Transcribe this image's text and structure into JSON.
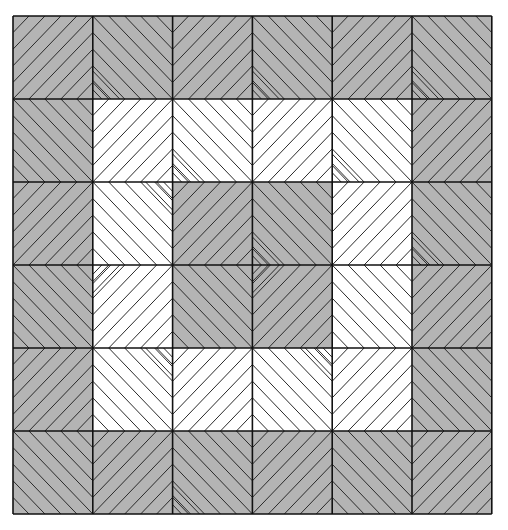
{
  "pattern": {
    "grid": {
      "rows": 6,
      "cols": 6,
      "left": 13,
      "top": 16,
      "cell_w": 79.8,
      "cell_h": 83
    },
    "colors": {
      "gray": "#b4b4b4",
      "white": "#ffffff",
      "line": "#2a2a2a",
      "border": "#111111"
    },
    "cells": [
      [
        {
          "fill": "gray",
          "dir": "up"
        },
        {
          "fill": "gray",
          "dir": "down",
          "corner": "bl"
        },
        {
          "fill": "gray",
          "dir": "up"
        },
        {
          "fill": "gray",
          "dir": "down",
          "corner": "bl"
        },
        {
          "fill": "gray",
          "dir": "up"
        },
        {
          "fill": "gray",
          "dir": "down",
          "corner": "bl"
        }
      ],
      [
        {
          "fill": "gray",
          "dir": "down"
        },
        {
          "fill": "white",
          "dir": "up"
        },
        {
          "fill": "white",
          "dir": "down",
          "corner": "bl"
        },
        {
          "fill": "white",
          "dir": "up"
        },
        {
          "fill": "white",
          "dir": "down",
          "corner": "bl"
        },
        {
          "fill": "gray",
          "dir": "up"
        }
      ],
      [
        {
          "fill": "gray",
          "dir": "up"
        },
        {
          "fill": "white",
          "dir": "down",
          "corner": "tr"
        },
        {
          "fill": "gray",
          "dir": "up"
        },
        {
          "fill": "gray",
          "dir": "down",
          "corner": "bl"
        },
        {
          "fill": "white",
          "dir": "up"
        },
        {
          "fill": "gray",
          "dir": "down",
          "corner": "bl"
        }
      ],
      [
        {
          "fill": "gray",
          "dir": "down"
        },
        {
          "fill": "white",
          "dir": "up",
          "corner": "tl"
        },
        {
          "fill": "gray",
          "dir": "down"
        },
        {
          "fill": "gray",
          "dir": "up",
          "corner": "tl"
        },
        {
          "fill": "white",
          "dir": "down"
        },
        {
          "fill": "gray",
          "dir": "up"
        }
      ],
      [
        {
          "fill": "gray",
          "dir": "up"
        },
        {
          "fill": "white",
          "dir": "down",
          "corner": "tr"
        },
        {
          "fill": "white",
          "dir": "up"
        },
        {
          "fill": "white",
          "dir": "down",
          "corner": "tr"
        },
        {
          "fill": "white",
          "dir": "up"
        },
        {
          "fill": "gray",
          "dir": "down"
        }
      ],
      [
        {
          "fill": "gray",
          "dir": "down"
        },
        {
          "fill": "gray",
          "dir": "up"
        },
        {
          "fill": "gray",
          "dir": "down",
          "corner": "bl"
        },
        {
          "fill": "gray",
          "dir": "up"
        },
        {
          "fill": "gray",
          "dir": "down"
        },
        {
          "fill": "gray",
          "dir": "up"
        }
      ]
    ],
    "lines_per_cell": 9,
    "corner_lines": 3
  }
}
